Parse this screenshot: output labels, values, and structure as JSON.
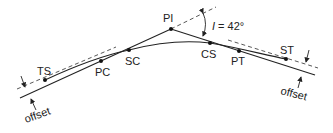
{
  "diagram": {
    "colors": {
      "line": "#222222",
      "dash": "#444444",
      "background": "#ffffff"
    },
    "points": [
      {
        "id": "TS",
        "label": "TS",
        "x": 45,
        "y": 80
      },
      {
        "id": "PC",
        "label": "PC",
        "x": 101,
        "y": 61
      },
      {
        "id": "SC",
        "label": "SC",
        "x": 129,
        "y": 50
      },
      {
        "id": "PI",
        "label": "PI",
        "x": 171,
        "y": 29
      },
      {
        "id": "CS",
        "label": "CS",
        "x": 210,
        "y": 43
      },
      {
        "id": "PT",
        "label": "PT",
        "x": 239,
        "y": 51
      },
      {
        "id": "ST",
        "label": "ST",
        "x": 286,
        "y": 59
      }
    ],
    "angle": {
      "symbol": "I",
      "text": " = 42°",
      "value_deg": 42
    },
    "offset_labels": {
      "left": "offset",
      "right": "offset"
    }
  }
}
